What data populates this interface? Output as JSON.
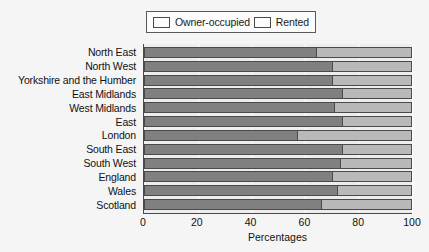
{
  "chart_data": {
    "type": "bar",
    "orientation": "horizontal",
    "stacked": true,
    "title": "",
    "xlabel": "Percentages",
    "ylabel": "",
    "xlim": [
      0,
      100
    ],
    "xticks": [
      0,
      20,
      40,
      60,
      80,
      100
    ],
    "grid": true,
    "legend_position": "top",
    "categories": [
      "North East",
      "North West",
      "Yorkshire and the Humber",
      "East Midlands",
      "West Midlands",
      "East",
      "London",
      "South East",
      "South West",
      "England",
      "Wales",
      "Scotland"
    ],
    "series": [
      {
        "name": "Owner-occupied",
        "color": "#808080",
        "values": [
          64,
          70,
          70,
          74,
          71,
          74,
          57,
          74,
          73,
          70,
          72,
          66
        ]
      },
      {
        "name": "Rented",
        "color": "#b9b9b9",
        "values": [
          36,
          30,
          30,
          26,
          29,
          26,
          43,
          26,
          27,
          30,
          28,
          34
        ]
      }
    ]
  },
  "legend": {
    "entries": [
      {
        "label": "Owner-occupied",
        "color": "#808080"
      },
      {
        "label": "Rented",
        "color": "#b9b9b9"
      }
    ]
  },
  "axis": {
    "x_title": "Percentages",
    "x_tick_labels": [
      "0",
      "20",
      "40",
      "60",
      "80",
      "100"
    ]
  },
  "colors": {
    "background": "#f5f5f5",
    "plot_background": "#ededed",
    "owner_occupied": "#808080",
    "rented": "#b9b9b9",
    "axis_line": "#4a4a4a",
    "gridline": "#ffffff",
    "text": "#111111"
  }
}
